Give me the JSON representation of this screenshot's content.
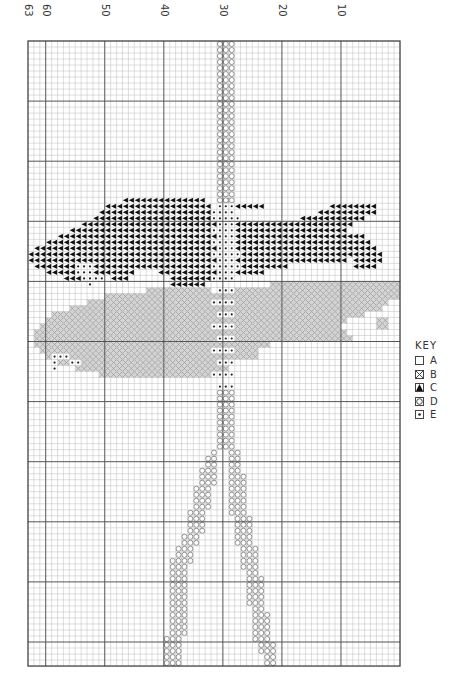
{
  "chart_data": {
    "type": "cross-stitch-pattern",
    "title": "",
    "grid": {
      "columns": 63,
      "rows": 104,
      "origin_px": [
        28,
        41
      ],
      "cell_w": 5.905,
      "cell_h": 6.01,
      "major_every": 10,
      "major_col_labels": [
        63,
        60,
        50,
        40,
        30,
        20,
        10
      ]
    },
    "colors": {
      "grid_minor": "#bdbdbd",
      "grid_major": "#555555",
      "border": "#333333",
      "symbol_C": "#111111",
      "symbol_B": "#9a9a9a",
      "symbol_D": "#8c8c8c",
      "symbol_E": "#222222"
    },
    "key": {
      "title": "KEY",
      "items": [
        {
          "symbol": "A",
          "glyph": "empty-square"
        },
        {
          "symbol": "B",
          "glyph": "crossed-square"
        },
        {
          "symbol": "C",
          "glyph": "black-triangle"
        },
        {
          "symbol": "D",
          "glyph": "circle-square"
        },
        {
          "symbol": "E",
          "glyph": "dot-square"
        }
      ]
    },
    "runs": {
      "C": [
        [
          26,
          16,
          29
        ],
        [
          26,
          33,
          33
        ],
        [
          27,
          13,
          30
        ],
        [
          27,
          35,
          39
        ],
        [
          27,
          51,
          58
        ],
        [
          28,
          12,
          30
        ],
        [
          28,
          49,
          58
        ],
        [
          29,
          11,
          31
        ],
        [
          29,
          46,
          56
        ],
        [
          30,
          9,
          31
        ],
        [
          30,
          35,
          54
        ],
        [
          31,
          7,
          31
        ],
        [
          31,
          35,
          53
        ],
        [
          32,
          5,
          31
        ],
        [
          32,
          35,
          56
        ],
        [
          33,
          3,
          31
        ],
        [
          33,
          35,
          57
        ],
        [
          34,
          1,
          31
        ],
        [
          34,
          35,
          58
        ],
        [
          35,
          0,
          31
        ],
        [
          35,
          35,
          59
        ],
        [
          36,
          0,
          31
        ],
        [
          36,
          35,
          53
        ],
        [
          36,
          55,
          59
        ],
        [
          37,
          1,
          31
        ],
        [
          37,
          35,
          43
        ],
        [
          37,
          55,
          58
        ],
        [
          38,
          3,
          17
        ],
        [
          38,
          22,
          31
        ],
        [
          38,
          35,
          39
        ],
        [
          39,
          6,
          9
        ],
        [
          39,
          14,
          16
        ],
        [
          39,
          24,
          31
        ],
        [
          40,
          24,
          29
        ]
      ],
      "B": [
        [
          40,
          41,
          62
        ],
        [
          41,
          32,
          62
        ],
        [
          41,
          20,
          30
        ],
        [
          42,
          13,
          62
        ],
        [
          43,
          10,
          60
        ],
        [
          44,
          7,
          59
        ],
        [
          45,
          4,
          56
        ],
        [
          46,
          3,
          53
        ],
        [
          46,
          59,
          60
        ],
        [
          47,
          2,
          52
        ],
        [
          47,
          59,
          60
        ],
        [
          48,
          1,
          53
        ],
        [
          49,
          1,
          54
        ],
        [
          50,
          1,
          40
        ],
        [
          51,
          2,
          38
        ],
        [
          52,
          3,
          38
        ],
        [
          53,
          5,
          33
        ],
        [
          54,
          8,
          33
        ],
        [
          55,
          12,
          33
        ]
      ],
      "E": [
        [
          27,
          32,
          34
        ],
        [
          28,
          31,
          34
        ],
        [
          29,
          31,
          35
        ],
        [
          30,
          32,
          34
        ],
        [
          31,
          31,
          34
        ],
        [
          32,
          32,
          34
        ],
        [
          33,
          31,
          34
        ],
        [
          34,
          32,
          34
        ],
        [
          35,
          31,
          35
        ],
        [
          36,
          32,
          34
        ],
        [
          37,
          31,
          35
        ],
        [
          38,
          32,
          34
        ],
        [
          39,
          31,
          34
        ],
        [
          38,
          8,
          10
        ],
        [
          39,
          9,
          12
        ],
        [
          40,
          10,
          10
        ],
        [
          37,
          8,
          10
        ],
        [
          41,
          32,
          34
        ],
        [
          43,
          31,
          34
        ],
        [
          45,
          32,
          34
        ],
        [
          47,
          31,
          34
        ],
        [
          49,
          32,
          34
        ],
        [
          51,
          31,
          34
        ],
        [
          53,
          32,
          34
        ],
        [
          55,
          31,
          34
        ],
        [
          57,
          32,
          34
        ],
        [
          52,
          4,
          6
        ],
        [
          53,
          4,
          4
        ],
        [
          53,
          7,
          8
        ],
        [
          54,
          4,
          4
        ]
      ],
      "D": [
        [
          0,
          32,
          34
        ],
        [
          1,
          32,
          34
        ],
        [
          2,
          32,
          34
        ],
        [
          3,
          32,
          34
        ],
        [
          4,
          32,
          34
        ],
        [
          5,
          32,
          34
        ],
        [
          6,
          32,
          34
        ],
        [
          7,
          32,
          34
        ],
        [
          8,
          32,
          34
        ],
        [
          9,
          32,
          34
        ],
        [
          10,
          32,
          34
        ],
        [
          11,
          32,
          34
        ],
        [
          12,
          32,
          34
        ],
        [
          13,
          32,
          34
        ],
        [
          14,
          32,
          34
        ],
        [
          15,
          32,
          34
        ],
        [
          16,
          32,
          34
        ],
        [
          17,
          32,
          34
        ],
        [
          18,
          32,
          34
        ],
        [
          19,
          32,
          34
        ],
        [
          20,
          32,
          34
        ],
        [
          21,
          32,
          34
        ],
        [
          22,
          32,
          34
        ],
        [
          23,
          32,
          34
        ],
        [
          24,
          32,
          34
        ],
        [
          25,
          32,
          34
        ],
        [
          26,
          32,
          34
        ],
        [
          58,
          32,
          34
        ],
        [
          59,
          32,
          34
        ],
        [
          60,
          32,
          34
        ],
        [
          61,
          32,
          34
        ],
        [
          62,
          32,
          34
        ],
        [
          63,
          32,
          34
        ],
        [
          64,
          32,
          34
        ],
        [
          65,
          32,
          34
        ],
        [
          66,
          32,
          34
        ],
        [
          67,
          32,
          34
        ],
        [
          68,
          31,
          31
        ],
        [
          68,
          34,
          35
        ],
        [
          69,
          30,
          31
        ],
        [
          69,
          34,
          35
        ],
        [
          70,
          30,
          31
        ],
        [
          70,
          34,
          35
        ],
        [
          71,
          29,
          31
        ],
        [
          71,
          34,
          35
        ],
        [
          72,
          29,
          31
        ],
        [
          72,
          34,
          36
        ],
        [
          73,
          29,
          31
        ],
        [
          73,
          34,
          36
        ],
        [
          74,
          28,
          30
        ],
        [
          74,
          34,
          36
        ],
        [
          75,
          28,
          30
        ],
        [
          75,
          34,
          36
        ],
        [
          76,
          28,
          30
        ],
        [
          76,
          34,
          36
        ],
        [
          77,
          28,
          30
        ],
        [
          77,
          34,
          36
        ],
        [
          78,
          27,
          29
        ],
        [
          78,
          34,
          36
        ],
        [
          79,
          27,
          29
        ],
        [
          79,
          35,
          37
        ],
        [
          80,
          27,
          29
        ],
        [
          80,
          35,
          37
        ],
        [
          81,
          27,
          29
        ],
        [
          81,
          35,
          37
        ],
        [
          82,
          26,
          28
        ],
        [
          82,
          35,
          37
        ],
        [
          83,
          26,
          28
        ],
        [
          83,
          35,
          37
        ],
        [
          84,
          25,
          27
        ],
        [
          84,
          36,
          38
        ],
        [
          85,
          25,
          27
        ],
        [
          85,
          36,
          38
        ],
        [
          86,
          24,
          27
        ],
        [
          86,
          36,
          38
        ],
        [
          87,
          24,
          26
        ],
        [
          87,
          36,
          38
        ],
        [
          88,
          24,
          26
        ],
        [
          88,
          37,
          38
        ],
        [
          89,
          24,
          26
        ],
        [
          89,
          37,
          39
        ],
        [
          90,
          24,
          26
        ],
        [
          90,
          37,
          39
        ],
        [
          91,
          24,
          26
        ],
        [
          91,
          37,
          39
        ],
        [
          92,
          24,
          26
        ],
        [
          92,
          37,
          39
        ],
        [
          93,
          24,
          26
        ],
        [
          93,
          37,
          39
        ],
        [
          94,
          24,
          26
        ],
        [
          94,
          38,
          39
        ],
        [
          95,
          24,
          26
        ],
        [
          95,
          38,
          40
        ],
        [
          96,
          24,
          26
        ],
        [
          96,
          38,
          40
        ],
        [
          97,
          24,
          26
        ],
        [
          97,
          38,
          40
        ],
        [
          98,
          24,
          26
        ],
        [
          98,
          38,
          40
        ],
        [
          99,
          23,
          25
        ],
        [
          99,
          38,
          40
        ],
        [
          100,
          23,
          25
        ],
        [
          100,
          39,
          41
        ],
        [
          101,
          23,
          25
        ],
        [
          101,
          39,
          41
        ],
        [
          102,
          23,
          25
        ],
        [
          102,
          40,
          41
        ],
        [
          103,
          23,
          25
        ],
        [
          103,
          40,
          41
        ]
      ]
    }
  }
}
